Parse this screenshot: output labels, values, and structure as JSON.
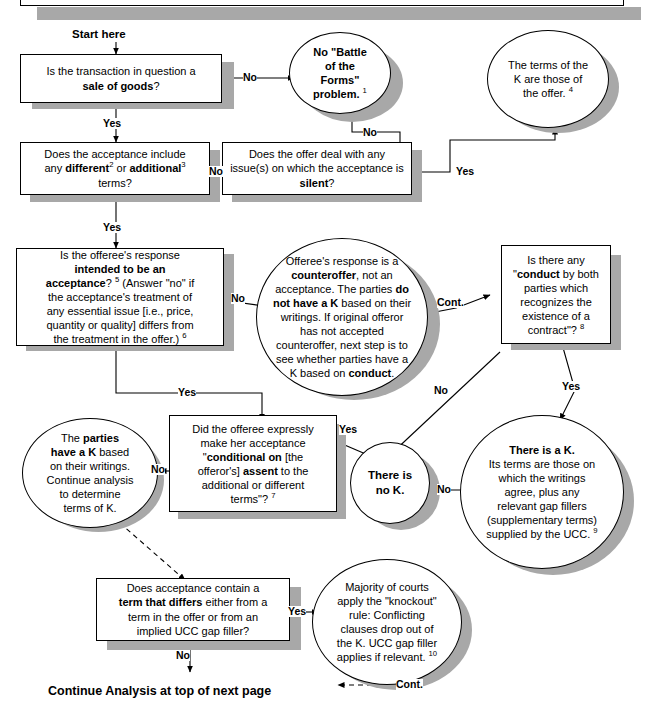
{
  "labels": {
    "start": "Start here",
    "yes": "Yes",
    "no": "No",
    "cont": "Cont.",
    "footer": "Continue Analysis at top of next page"
  },
  "nodes": {
    "sale_of_goods": {
      "shape": "rect",
      "text_html": "Is the transaction in question a<br><b>sale of goods</b>?",
      "plain": "Is the transaction in question a sale of goods?"
    },
    "no_battle": {
      "shape": "ellipse",
      "text_html": "<b>No \"Battle<br>of the<br>Forms\"<br>problem.</b> <sup>1</sup>",
      "plain": "No \"Battle of the Forms\" problem. 1"
    },
    "terms_of_offer": {
      "shape": "ellipse",
      "text_html": "The terms of the<br>K are those of<br>the offer. <sup>4</sup>",
      "plain": "The terms of the K are those of the offer. 4"
    },
    "acceptance_include": {
      "shape": "rect",
      "text_html": "Does the acceptance include<br>any <b>different</b><sup>2</sup> or <b>additional</b><sup>3</sup><br>terms?",
      "plain": "Does the acceptance include any different2 or additional3 terms?"
    },
    "offer_silent": {
      "shape": "rect",
      "text_html": "Does the offer deal with any<br>issue(s) on which the acceptance is<br><b>silent</b>?",
      "plain": "Does the offer deal with any issue(s) on which the acceptance is silent?"
    },
    "intended_acceptance": {
      "shape": "rect",
      "text_html": "Is the offeree's response<br><b>intended to be an</b><br><b>acceptance</b>? <sup>5</sup> (Answer \"no\" if<br>the acceptance's treatment of<br>any essential issue [i.e., price,<br>quantity or quality] differs from<br>the treatment in the offer.) <sup>6</sup>",
      "plain": "Is the offeree's response intended to be an acceptance? 5 (Answer \"no\" if the acceptance's treatment of any essential issue [i.e., price, quantity or quality] differs from the treatment in the offer.) 6"
    },
    "counteroffer": {
      "shape": "ellipse",
      "text_html": "Offeree's response is a<br><b>counteroffer</b>, not an<br>acceptance. The parties <b>do</b><br><b>not have a K</b> based on their<br>writings. If original offeror<br>has not accepted<br>counteroffer, next step is to<br>see whether parties have a<br>K based on <b>conduct</b>.",
      "plain": "Offeree's response is a counteroffer, not an acceptance. The parties do not have a K based on their writings. If original offeror has not accepted counteroffer, next step is to see whether parties have a K based on conduct."
    },
    "conduct": {
      "shape": "rect",
      "text_html": "Is there any<br>\"<b>conduct</b> by both<br>parties which<br>recognizes the<br>existence of a<br>contract\"? <sup>8</sup>",
      "plain": "Is there any \"conduct by both parties which recognizes the existence of a contract\"? 8"
    },
    "parties_have_k": {
      "shape": "ellipse",
      "text_html": "The <b>parties</b><br><b>have a K</b> based<br>on their writings.<br>Continue analysis<br>to determine<br>terms of K.",
      "plain": "The parties have a K based on their writings. Continue analysis to determine terms of K."
    },
    "conditional_on": {
      "shape": "rect",
      "text_html": "Did the offeree expressly<br>make her acceptance<br>\"<b>conditional on</b> [the<br>offeror's] <b>assent</b> to the<br>additional or different<br>terms\"? <sup>7</sup>",
      "plain": "Did the offeree expressly make her acceptance \"conditional on [the offeror's] assent to the additional or different terms\"? 7"
    },
    "no_k": {
      "shape": "ellipse",
      "text_html": "<b>There is</b><br><b>no K.</b>",
      "plain": "There is no K."
    },
    "there_is_a_k": {
      "shape": "ellipse",
      "text_html": "<b>There is a K.</b><br>Its terms are those on<br>which the writings<br>agree, plus any<br>relevant gap fillers<br>(supplementary terms)<br>supplied by the UCC. <sup>9</sup>",
      "plain": "There is a K. Its terms are those on which the writings agree, plus any relevant gap fillers (supplementary terms) supplied by the UCC. 9"
    },
    "term_that_differs": {
      "shape": "rect",
      "text_html": "Does acceptance contain a<br><b>term that differs</b> either from a<br>term in the offer or from an<br>implied UCC gap filler?",
      "plain": "Does acceptance contain a term that differs either from a term in the offer or from an implied UCC gap filler?"
    },
    "knockout": {
      "shape": "ellipse",
      "text_html": "Majority of courts<br>apply the \"knockout\"<br>rule: Conflicting<br>clauses drop out of<br>the K. UCC gap filler<br>applies if relevant. <sup>10</sup>",
      "plain": "Majority of courts apply the \"knockout\" rule: Conflicting clauses drop out of the K. UCC gap filler applies if relevant. 10"
    }
  },
  "edge_labels": [
    {
      "id": "e1",
      "text": "No"
    },
    {
      "id": "e2",
      "text": "Yes"
    },
    {
      "id": "e3",
      "text": "No"
    },
    {
      "id": "e4",
      "text": "No"
    },
    {
      "id": "e5",
      "text": "Yes"
    },
    {
      "id": "e6",
      "text": "Yes"
    },
    {
      "id": "e7",
      "text": "No"
    },
    {
      "id": "e8",
      "text": "Yes"
    },
    {
      "id": "e9",
      "text": "Cont."
    },
    {
      "id": "e10",
      "text": "Yes"
    },
    {
      "id": "e11",
      "text": "No"
    },
    {
      "id": "e12",
      "text": "No"
    },
    {
      "id": "e13",
      "text": "Yes"
    },
    {
      "id": "e14",
      "text": "No"
    },
    {
      "id": "e15",
      "text": "No"
    },
    {
      "id": "e16",
      "text": "Yes"
    },
    {
      "id": "e17",
      "text": "Cont."
    }
  ],
  "colors": {
    "shadow": "#a8a8a8",
    "line": "#000000",
    "background": "#ffffff"
  }
}
